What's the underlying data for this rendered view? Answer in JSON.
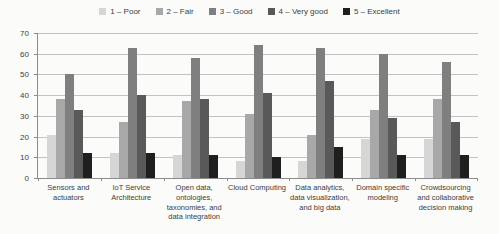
{
  "chart_data": {
    "type": "bar",
    "title": "",
    "xlabel": "",
    "ylabel": "",
    "ylim": [
      0,
      70
    ],
    "ytick_step": 10,
    "grid": true,
    "legend_position": "top",
    "categories": [
      "Sensors and actuators",
      "IoT Service Architecture",
      "Open data, ontologies, taxonomies, and data integration",
      "Cloud Computing",
      "Data analytics, data visualization, and big data",
      "Domain specific modeling",
      "Crowdsourcing and collaborative decision making"
    ],
    "series": [
      {
        "name": "1 – Poor",
        "color": "#d6d6d6",
        "values": [
          21,
          12,
          11,
          8,
          8,
          19,
          19
        ]
      },
      {
        "name": "2 – Fair",
        "color": "#a8a8a8",
        "values": [
          38,
          27,
          37,
          31,
          21,
          33,
          38
        ]
      },
      {
        "name": "3 – Good",
        "color": "#7f7f7f",
        "values": [
          50,
          63,
          58,
          64,
          63,
          60,
          56
        ]
      },
      {
        "name": "4 – Very good",
        "color": "#595959",
        "values": [
          33,
          40,
          38,
          41,
          47,
          29,
          27
        ]
      },
      {
        "name": "5 – Excellent",
        "color": "#1f1f1f",
        "values": [
          12,
          12,
          11,
          10,
          15,
          11,
          11
        ]
      }
    ]
  },
  "colors": {
    "background": "#fbfbfa",
    "gridline": "#c2c2c2",
    "axis": "#8c8c8c",
    "text": "#3d3d3d"
  }
}
